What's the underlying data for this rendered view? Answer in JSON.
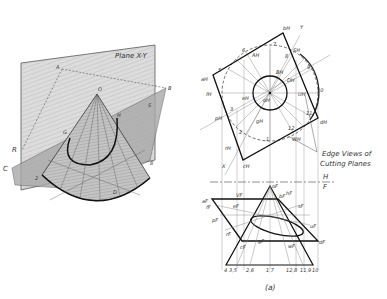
{
  "figure": {
    "caption": "(a)",
    "colors": {
      "ink": "#222222",
      "shade": "#b8b8b8",
      "plane": "#d6d6d6",
      "bg": "#ffffff"
    }
  },
  "pictorial": {
    "plane_label": "Plane X-Y",
    "points": [
      "A",
      "B",
      "O",
      "S",
      "H",
      "G",
      "R",
      "C",
      "2",
      "D",
      "8"
    ]
  },
  "orthographic": {
    "top_view": {
      "labels": [
        "bH",
        "Y",
        "6",
        "8",
        "7",
        "SH",
        "aH",
        "5",
        "AH",
        "BH",
        "eH",
        "DH",
        "9",
        "fH",
        "oH",
        "UH",
        "10",
        "3",
        "pH",
        "gH",
        "11",
        "dH",
        "2",
        "1",
        "12",
        "WH",
        "rH",
        "X",
        "cH"
      ]
    },
    "annotation": "Edge Views of\nCutting Planes",
    "annotation_line1": "Edge Views of",
    "annotation_line2": "Cutting Planes",
    "fold_line": {
      "upper": "H",
      "lower": "F"
    },
    "front_view": {
      "labels": [
        "aF",
        "oF",
        "VF",
        "hF",
        "fF",
        "eF",
        "sF",
        "bF",
        "pF",
        "gF",
        "uF",
        "dF",
        "rF",
        "cF",
        "wF"
      ],
      "baseline_ticks": [
        "4",
        "3,5",
        "2,6",
        "1,7",
        "12,8",
        "11,9",
        "10"
      ]
    }
  }
}
